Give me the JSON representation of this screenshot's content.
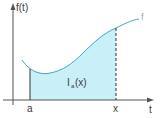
{
  "diagram": {
    "y_axis_label": "f(t)",
    "x_axis_label": "t",
    "curve_label": "f",
    "lower_bound_label": "a",
    "upper_bound_label": "x",
    "area_label_main": "I",
    "area_label_sub": "a",
    "area_label_arg": "(x)",
    "colors": {
      "axis": "#555555",
      "curve": "#4aa3c8",
      "fill": "#c9f0f8",
      "dashed": "#333333"
    }
  }
}
